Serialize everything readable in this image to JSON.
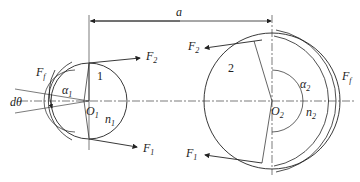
{
  "diagram": {
    "center_distance_label": "a",
    "pulley_small": {
      "number": "1",
      "center": "O",
      "center_sub": "1",
      "wrap_angle": "α",
      "wrap_angle_sub": "1",
      "speed": "n",
      "speed_sub": "1",
      "friction_label": "F",
      "friction_sub": "f",
      "element_angle": "dθ"
    },
    "pulley_large": {
      "number": "2",
      "center": "O",
      "center_sub": "2",
      "wrap_angle": "α",
      "wrap_angle_sub": "2",
      "speed": "n",
      "speed_sub": "2",
      "friction_label": "F",
      "friction_sub": "f"
    },
    "tensions": {
      "tight_upper_small": {
        "label": "F",
        "sub": "2"
      },
      "slack_lower_small": {
        "label": "F",
        "sub": "1"
      },
      "upper_large": {
        "label": "F",
        "sub": "2"
      },
      "lower_large": {
        "label": "F",
        "sub": "1"
      }
    },
    "colors": {
      "line": "#222222",
      "background": "#ffffff"
    }
  }
}
